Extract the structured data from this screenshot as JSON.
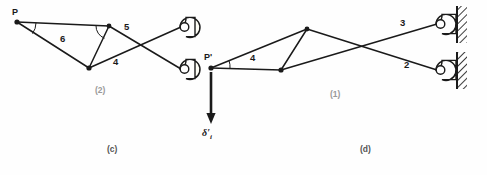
{
  "figure": {
    "title_c": "(c)",
    "title_d": "(d)",
    "panel_left_caption": "(2)",
    "panel_right_caption": "(1)"
  },
  "diagram_c": {
    "name": "truss-diagram-c",
    "nodes": [
      {
        "id": "P",
        "label": "P",
        "x": 17,
        "y": 22,
        "label_dx": -2,
        "label_dy": -12
      },
      {
        "id": "T",
        "label": "",
        "x": 109,
        "y": 26
      },
      {
        "id": "B",
        "label": "",
        "x": 89,
        "y": 68
      }
    ],
    "members": [
      {
        "id": "m-P-T",
        "label": "",
        "x1": 17,
        "y1": 22,
        "x2": 109,
        "y2": 26
      },
      {
        "id": "m-P-B",
        "label": "",
        "x1": 17,
        "y1": 22,
        "x2": 89,
        "y2": 68
      },
      {
        "id": "m-T-B",
        "label": "",
        "x1": 109,
        "y1": 26,
        "x2": 89,
        "y2": 68
      },
      {
        "id": "m-5",
        "label": "5",
        "x1": 109,
        "y1": 26,
        "x2": 180,
        "y2": 68
      },
      {
        "id": "m-4",
        "label": "4",
        "x1": 89,
        "y1": 68,
        "x2": 180,
        "y2": 26
      }
    ],
    "member_labels": [
      {
        "id": "label-6",
        "text": "6",
        "x": 63,
        "y": 39
      },
      {
        "id": "label-5",
        "text": "5",
        "x": 126,
        "y": 28
      },
      {
        "id": "label-4",
        "text": "4",
        "x": 114,
        "y": 61
      }
    ],
    "supports": [
      {
        "id": "eyebar-upper",
        "x": 173,
        "y": 17,
        "w": 22,
        "h": 20
      },
      {
        "id": "eyebar-lower",
        "x": 173,
        "y": 59,
        "w": 22,
        "h": 20
      }
    ]
  },
  "diagram_d": {
    "name": "truss-diagram-d",
    "nodes": [
      {
        "id": "Pp",
        "label": "P'",
        "x": 211,
        "y": 68,
        "label_dx": -4,
        "label_dy": -13
      },
      {
        "id": "T",
        "label": "",
        "x": 307,
        "y": 29
      },
      {
        "id": "B",
        "label": "",
        "x": 281,
        "y": 70
      }
    ],
    "members": [
      {
        "id": "m-Pp-T",
        "label": "",
        "x1": 211,
        "y1": 68,
        "x2": 307,
        "y2": 29
      },
      {
        "id": "m-Pp-B",
        "label": "",
        "x1": 211,
        "y1": 68,
        "x2": 281,
        "y2": 70
      },
      {
        "id": "m-T-B",
        "label": "",
        "x1": 307,
        "y1": 29,
        "x2": 281,
        "y2": 70
      },
      {
        "id": "m-3",
        "label": "3",
        "x1": 281,
        "y1": 70,
        "x2": 437,
        "y2": 24
      },
      {
        "id": "m-2",
        "label": "2",
        "x1": 307,
        "y1": 29,
        "x2": 437,
        "y2": 70
      }
    ],
    "member_labels": [
      {
        "id": "label-4",
        "text": "4",
        "x": 253,
        "y": 57
      },
      {
        "id": "label-3",
        "text": "3",
        "x": 402,
        "y": 22
      },
      {
        "id": "label-2",
        "text": "2",
        "x": 406,
        "y": 64
      }
    ],
    "supports": [
      {
        "id": "wall-support-upper",
        "x": 433,
        "y": 14,
        "w": 24,
        "h": 20,
        "wall_x": 457,
        "wall_y": 6,
        "wall_w": 11,
        "wall_h": 36
      },
      {
        "id": "wall-support-lower",
        "x": 433,
        "y": 60,
        "w": 24,
        "h": 20,
        "wall_x": 457,
        "wall_y": 52,
        "wall_w": 11,
        "wall_h": 36
      }
    ],
    "load_arrow": {
      "id": "displacement-arrow",
      "label": "δ",
      "prime": "′",
      "subscript": "i",
      "x": 211,
      "y1": 72,
      "y2": 124,
      "label_x": 203,
      "label_y": 131
    }
  }
}
